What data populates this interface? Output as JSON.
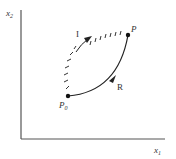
{
  "diagram": {
    "axes": {
      "x_label": "x",
      "x_sub": "1",
      "y_label": "x",
      "y_sub": "2"
    },
    "points": {
      "start": {
        "label": "P",
        "sub": "0"
      },
      "end": {
        "label": "P",
        "sub": ""
      }
    },
    "paths": {
      "reversible": {
        "label": "R",
        "style": "solid"
      },
      "irreversible": {
        "label": "I",
        "style": "hatched"
      }
    },
    "colors": {
      "axis": "#555555",
      "curve": "#222222",
      "text": "#333333",
      "background": "#ffffff"
    }
  }
}
